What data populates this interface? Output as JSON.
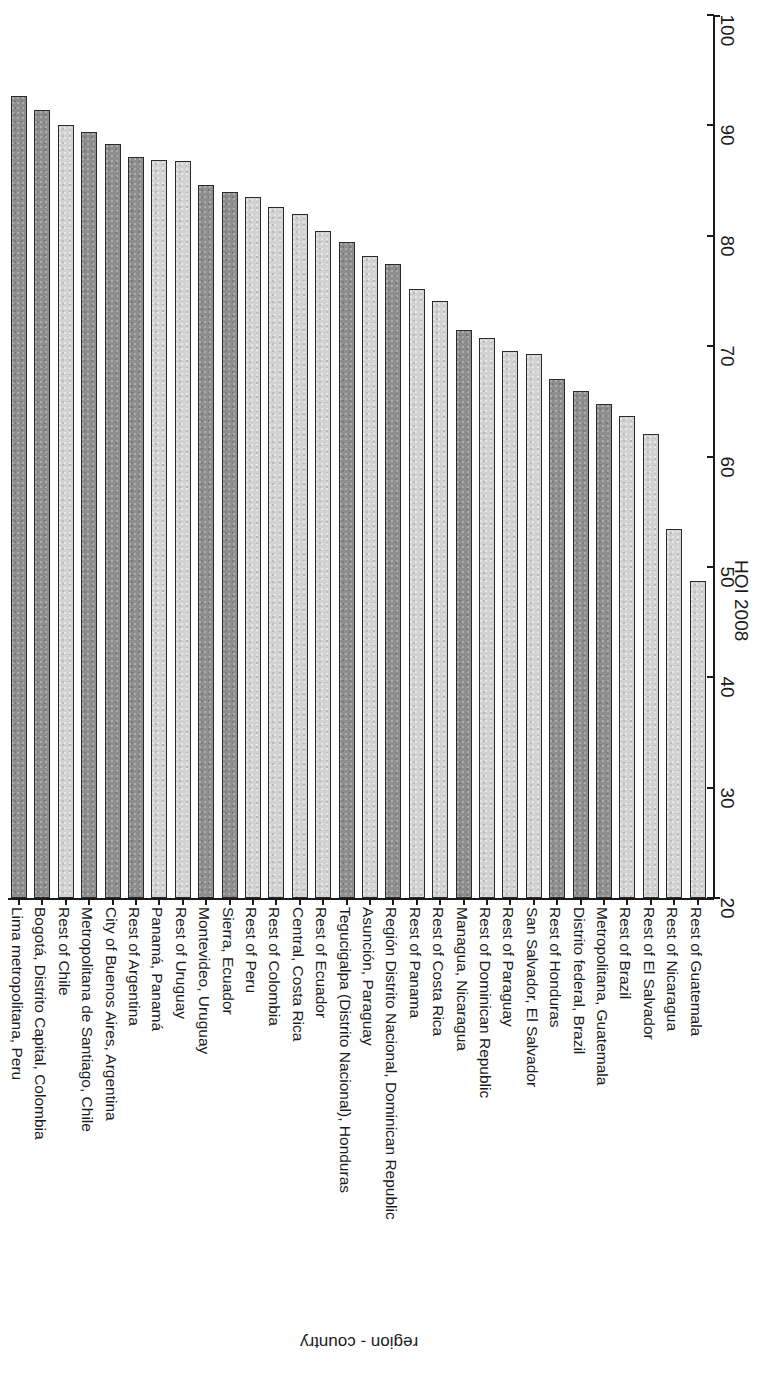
{
  "chart_data": {
    "type": "bar",
    "title": "",
    "subtitle": "",
    "orientation": "vertical-bars-rotated",
    "xlabel": "region - country",
    "ylabel": "HOI 2008",
    "ylim": [
      20,
      100
    ],
    "yticks": [
      20,
      30,
      40,
      50,
      60,
      70,
      80,
      90,
      100
    ],
    "grid": false,
    "legend": "none",
    "categories": [
      "Lima metropolitana, Peru",
      "Bogotá, Distrito Capital, Colombia",
      "Rest of Chile",
      "Metropolitana de Santiago, Chile",
      "City of Buenos Aires, Argentina",
      "Rest of Argentina",
      "Panamá, Panamá",
      "Rest of Uruguay",
      "Montevideo, Uruguay",
      "Sierra, Ecuador",
      "Rest of Peru",
      "Rest of Colombia",
      "Central, Costa Rica",
      "Rest of Ecuador",
      "Tegucigalpa (Distrito Nacional), Honduras",
      "Asunción, Paraguay",
      "Región Distrito Nacional, Dominican Republic",
      "Rest of Panama",
      "Rest of Costa Rica",
      "Managua, Nicaragua",
      "Rest of Dominican Republic",
      "Rest of Paraguay",
      "San Salvador, El Salvador",
      "Rest of Honduras",
      "Distrito federal, Brazil",
      "Metropolitana, Guatemala",
      "Rest of Brazil",
      "Rest of El Salvador",
      "Rest of Nicaragua",
      "Rest of Guatemala"
    ],
    "values": [
      92.7,
      91.4,
      90.0,
      89.4,
      88.3,
      87.1,
      86.9,
      86.8,
      84.6,
      84.0,
      83.5,
      82.6,
      82.0,
      80.4,
      79.4,
      78.2,
      77.4,
      75.2,
      74.1,
      71.5,
      70.7,
      69.6,
      69.3,
      67.0,
      65.9,
      64.8,
      63.7,
      62.0,
      53.4,
      48.7
    ],
    "shades": [
      "dark",
      "dark",
      "light",
      "dark",
      "dark",
      "dark",
      "light",
      "light",
      "dark",
      "dark",
      "light",
      "light",
      "light",
      "light",
      "dark",
      "light",
      "dark",
      "light",
      "light",
      "dark",
      "light",
      "light",
      "light",
      "dark",
      "dark",
      "dark",
      "light",
      "light",
      "light",
      "light"
    ],
    "series": [
      {
        "name": "HOI 2008",
        "values": [
          92.7,
          91.4,
          90.0,
          89.4,
          88.3,
          87.1,
          86.9,
          86.8,
          84.6,
          84.0,
          83.5,
          82.6,
          82.0,
          80.4,
          79.4,
          78.2,
          77.4,
          75.2,
          74.1,
          71.5,
          70.7,
          69.6,
          69.3,
          67.0,
          65.9,
          64.8,
          63.7,
          62.0,
          53.4,
          48.7
        ]
      }
    ],
    "footnote_markers": {
      "Sierra,  Ecuador": "a"
    }
  },
  "axis": {
    "value_axis_title": "HOI 2008",
    "category_axis_title": "region - country",
    "tick_labels": [
      "20",
      "30",
      "40",
      "50",
      "60",
      "70",
      "80",
      "90",
      "100"
    ]
  },
  "colors": {
    "bar_dark": "#8e8e8e",
    "bar_light": "#d2d2d2",
    "bar_border": "#2b2b2b",
    "axis": "#1a1a1a",
    "background": "#ffffff"
  }
}
